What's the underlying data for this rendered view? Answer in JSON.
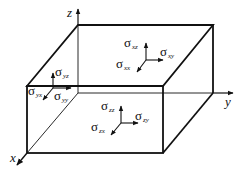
{
  "diagram": {
    "type": "stress-element-box",
    "axes": [
      {
        "name": "z",
        "label": "z"
      },
      {
        "name": "y",
        "label": "y"
      },
      {
        "name": "x",
        "label": "x"
      }
    ],
    "stress_groups": [
      {
        "face": "top",
        "components": [
          {
            "symbol": "σ",
            "sub": "xz"
          },
          {
            "symbol": "σ",
            "sub": "xy"
          },
          {
            "symbol": "σ",
            "sub": "xx"
          }
        ]
      },
      {
        "face": "left",
        "components": [
          {
            "symbol": "σ",
            "sub": "yz"
          },
          {
            "symbol": "σ",
            "sub": "yx"
          },
          {
            "symbol": "σ",
            "sub": "yy"
          }
        ]
      },
      {
        "face": "front",
        "components": [
          {
            "symbol": "σ",
            "sub": "zz"
          },
          {
            "symbol": "σ",
            "sub": "zy"
          },
          {
            "symbol": "σ",
            "sub": "zx"
          }
        ]
      }
    ],
    "colors": {
      "line": "#111111",
      "background": "#ffffff"
    }
  }
}
